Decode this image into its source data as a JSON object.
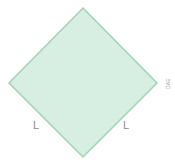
{
  "diagram": {
    "shape": "square rotated 45deg (diamond)",
    "fill_color": "#d6efe2",
    "stroke_color": "#a3d2b5",
    "vertices": {
      "top": [
        83,
        8
      ],
      "right": [
        157,
        83
      ],
      "bottom": [
        83,
        157
      ],
      "left": [
        9,
        83
      ]
    },
    "labels": {
      "bottom_left_side": "L",
      "bottom_right_side": "L",
      "right_vertex_tag": "DAE"
    }
  }
}
